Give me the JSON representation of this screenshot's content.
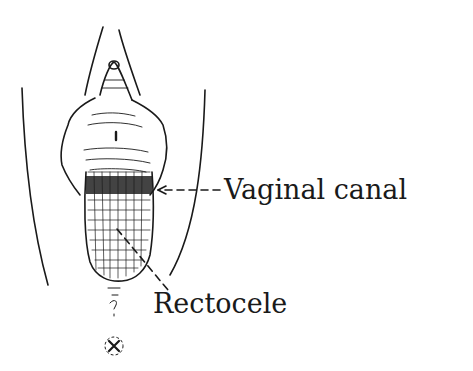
{
  "diagram": {
    "labels": [
      {
        "id": "vaginal-canal",
        "text": "Vaginal canal"
      },
      {
        "id": "rectocele",
        "text": "Rectocele"
      }
    ],
    "colors": {
      "ink": "#1a1a1a",
      "background": "#ffffff"
    }
  }
}
